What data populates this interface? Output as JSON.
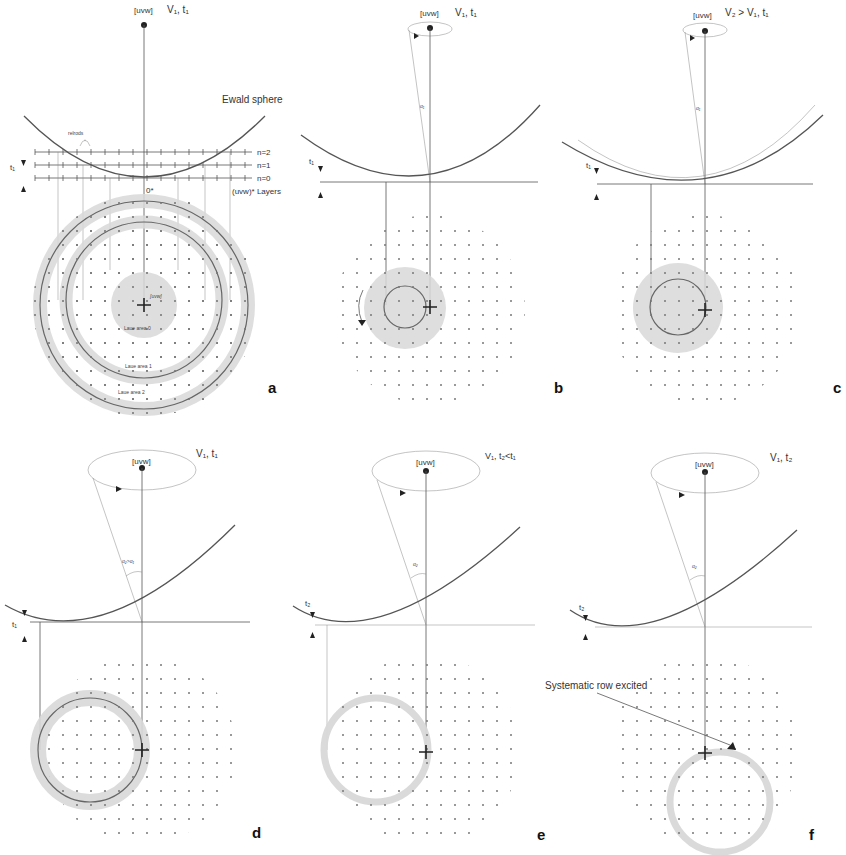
{
  "figure": {
    "type": "diagram",
    "accent_color": "#d8d8d8",
    "line_color": "#555555"
  },
  "panels": [
    {
      "id": "a",
      "letter": "a",
      "zone_axis_label": "[uvw]",
      "condition_label": "V₁, t₁",
      "ewald_label": "Ewald sphere",
      "relrods_label": "relrods",
      "thickness_label": "t₁",
      "layer_labels": [
        "n=2",
        "n=1",
        "n=0"
      ],
      "origin_label": "0*",
      "layers_label": "(uvw)* Layers",
      "center_label": "[uvw]",
      "laue_zones": [
        "Laue area 0",
        "Laue area 1",
        "Laue area 2"
      ]
    },
    {
      "id": "b",
      "letter": "b",
      "zone_axis_label": "[uvw]",
      "condition_label": "V₁, t₁",
      "angle_label": "α₁",
      "thickness_label": "t₁"
    },
    {
      "id": "c",
      "letter": "c",
      "zone_axis_label": "[uvw]",
      "condition_label": "V₂ > V₁, t₁",
      "angle_label": "α₁",
      "thickness_label": "t₁"
    },
    {
      "id": "d",
      "letter": "d",
      "zone_axis_label": "[uvw]",
      "condition_label": "V₁, t₁",
      "angle_label": "α₂>α₁",
      "thickness_label": "t₁"
    },
    {
      "id": "e",
      "letter": "e",
      "zone_axis_label": "[uvw]",
      "condition_label": "V₁, t₂<t₁",
      "angle_label": "α₂",
      "thickness_label": "t₂"
    },
    {
      "id": "f",
      "letter": "f",
      "zone_axis_label": "[uvw]",
      "condition_label": "V₁, t₂",
      "angle_label": "α₂",
      "thickness_label": "t₂",
      "annotation": "Systematic row excited"
    }
  ]
}
